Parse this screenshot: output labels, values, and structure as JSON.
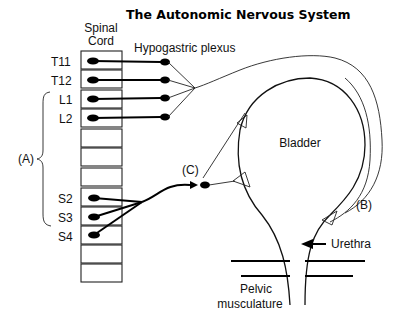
{
  "title": "The Autonomic Nervous System",
  "spinal_cord": {
    "label_line1": "Spinal",
    "label_line2": "Cord",
    "segments": [
      {
        "label": "T11",
        "has_neuron": true
      },
      {
        "label": "T12",
        "has_neuron": true
      },
      {
        "label": "L1",
        "has_neuron": true
      },
      {
        "label": "L2",
        "has_neuron": true
      },
      {
        "label": "",
        "has_neuron": false
      },
      {
        "label": "",
        "has_neuron": false
      },
      {
        "label": "",
        "has_neuron": false
      },
      {
        "label": "S2",
        "has_neuron": true
      },
      {
        "label": "S3",
        "has_neuron": true
      },
      {
        "label": "S4",
        "has_neuron": true
      },
      {
        "label": "",
        "has_neuron": false
      },
      {
        "label": "",
        "has_neuron": false
      }
    ]
  },
  "labels": {
    "hypogastric_plexus": "Hypogastric plexus",
    "bladder": "Bladder",
    "urethra": "Urethra",
    "pelvic_line1": "Pelvic",
    "pelvic_line2": "musculature",
    "A": "(A)",
    "B": "(B)",
    "C": "(C)"
  },
  "colors": {
    "ink": "#000000",
    "background": "#ffffff"
  }
}
